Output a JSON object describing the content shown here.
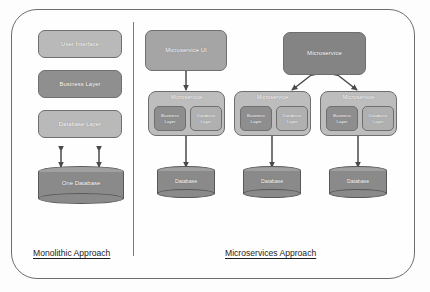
{
  "diagram": {
    "title_left": "Monolithic Approach",
    "title_right": "Microservices Approach",
    "colors": {
      "frame_stroke": "#6d6d6d",
      "box_light": "#b9b9b9",
      "box_mid": "#a5a5a5",
      "box_dark": "#8f8f8f",
      "group_fill": "#bdbdbd",
      "sub_fill": "#8e8e8e",
      "cylinder_fill": "#8a8a8a",
      "cylinder_top": "#a0a0a0",
      "label_text": "#ffffff",
      "caption_text": "#1d1d1d",
      "background": "#fdfdfd"
    }
  },
  "monolith": {
    "layers": [
      {
        "label": "User Interface"
      },
      {
        "label": "Business Layer"
      },
      {
        "label": "Database Layer"
      }
    ],
    "database": {
      "label": "One Database"
    }
  },
  "microservices": {
    "ui": {
      "label": "Microservice UI"
    },
    "top_service": {
      "label": "Microservice"
    },
    "services": [
      {
        "title": "Microservice",
        "sub": [
          {
            "label": "Business Layer"
          },
          {
            "label": "Database Layer"
          }
        ],
        "database": {
          "label": "Database"
        }
      },
      {
        "title": "Microservice",
        "sub": [
          {
            "label": "Business Layer"
          },
          {
            "label": "Database Layer"
          }
        ],
        "database": {
          "label": "Database"
        }
      },
      {
        "title": "Microservice",
        "sub": [
          {
            "label": "Business Layer"
          },
          {
            "label": "Database Layer"
          }
        ],
        "database": {
          "label": "Database"
        }
      }
    ]
  }
}
